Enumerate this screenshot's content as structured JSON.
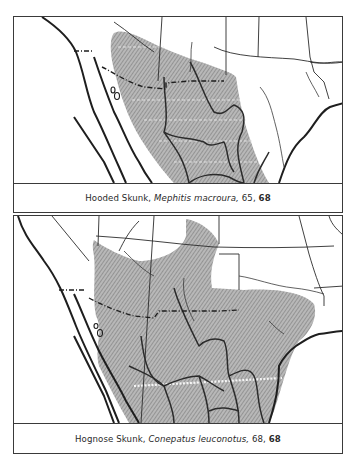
{
  "maps": [
    {
      "id": "hooded-skunk",
      "caption": {
        "common_name": "Hooded Skunk,",
        "scientific_name": "Mephitis macroura,",
        "ref1": "65,",
        "ref2": "68"
      },
      "range_fill": "#9a9a9a"
    },
    {
      "id": "hognose-skunk",
      "caption": {
        "common_name": "Hognose Skunk,",
        "scientific_name": "Conepatus leuconotus,",
        "ref1": "68,",
        "ref2": "68"
      },
      "range_fill": "#9a9a9a"
    }
  ]
}
